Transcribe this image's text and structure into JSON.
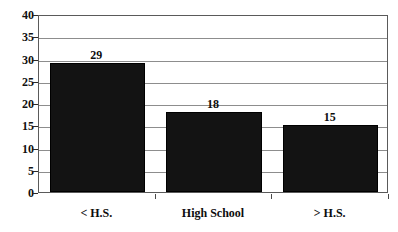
{
  "chart_data": {
    "type": "bar",
    "title": "",
    "subtitle": "",
    "xlabel": "",
    "ylabel": "",
    "categories": [
      "< H.S.",
      "High School",
      "> H.S."
    ],
    "values": [
      29,
      18,
      15
    ],
    "data_labels": [
      "29",
      "18",
      "15"
    ],
    "ylim": [
      0,
      40
    ],
    "y_ticks": [
      0,
      5,
      10,
      15,
      20,
      25,
      30,
      35,
      40
    ],
    "y_tick_labels": [
      "0",
      "5",
      "10",
      "15",
      "20",
      "25",
      "30",
      "35",
      "40"
    ],
    "grid": true,
    "grid_axis": "y",
    "legend": false,
    "legend_position": "none",
    "bar_color": "#131313",
    "grid_color": "#8d8d8d",
    "frame_color": "#5a5a5a",
    "text_color": "#0d0d0d",
    "background_color": "#ffffff"
  }
}
